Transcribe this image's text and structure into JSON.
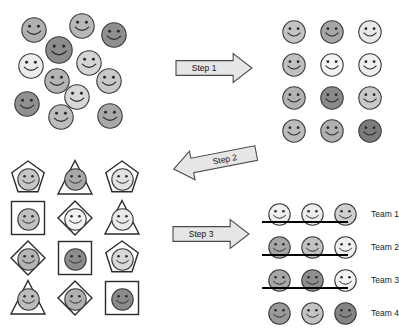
{
  "diagram": {
    "face_icon": "smiley-face-icon"
  },
  "panels": {
    "unsorted": {
      "name": "unsorted-crowd",
      "faces": [
        {
          "x": 21,
          "y": 17,
          "r": 13,
          "shade": "#b0b0b0"
        },
        {
          "x": 69,
          "y": 13,
          "r": 13,
          "shade": "#b8b8b8"
        },
        {
          "x": 101,
          "y": 22,
          "r": 13,
          "shade": "#8f8f8f"
        },
        {
          "x": 45,
          "y": 36,
          "r": 14,
          "shade": "#8c8c8c"
        },
        {
          "x": 18,
          "y": 53,
          "r": 13,
          "shade": "#ececec"
        },
        {
          "x": 76,
          "y": 50,
          "r": 13,
          "shade": "#d5d5d5"
        },
        {
          "x": 44,
          "y": 68,
          "r": 13,
          "shade": "#b4b4b4"
        },
        {
          "x": 96,
          "y": 68,
          "r": 13,
          "shade": "#c8c8c8"
        },
        {
          "x": 64,
          "y": 84,
          "r": 13,
          "shade": "#d8d8d8"
        },
        {
          "x": 14,
          "y": 91,
          "r": 13,
          "shade": "#909090"
        },
        {
          "x": 48,
          "y": 104,
          "r": 13,
          "shade": "#bdbdbd"
        },
        {
          "x": 97,
          "y": 103,
          "r": 13,
          "shade": "#a8a8a8"
        }
      ]
    },
    "sorted_grid": {
      "name": "sorted-grid",
      "origin": {
        "x": 282,
        "y": 20
      },
      "step_x": 38,
      "step_y": 33,
      "rows": [
        [
          "#c4c4c4",
          "#a6a6a6",
          "#e8e8e8"
        ],
        [
          "#c0c0c0",
          "#f2f2f2",
          "#f0f0f0"
        ],
        [
          "#b2b2b2",
          "#8a8a8a",
          "#c9c9c9"
        ],
        [
          "#bcbcbc",
          "#b0b0b0",
          "#7c7c7c"
        ]
      ]
    },
    "shaped_grid": {
      "name": "shaped-grid",
      "origin": {
        "x": 28,
        "y": 178
      },
      "step_x": 47,
      "step_y": 40,
      "cells": [
        [
          {
            "shape": "pentagon",
            "shade": "#c6c6c6"
          },
          {
            "shape": "triangle",
            "shade": "#a8a8a8"
          },
          {
            "shape": "pentagon",
            "shade": "#e2e2e2"
          }
        ],
        [
          {
            "shape": "square",
            "shade": "#c0c0c0"
          },
          {
            "shape": "diamond",
            "shade": "#f2f2f2"
          },
          {
            "shape": "triangle",
            "shade": "#eaeaea"
          }
        ],
        [
          {
            "shape": "diamond",
            "shade": "#b4b4b4"
          },
          {
            "shape": "square",
            "shade": "#8c8c8c"
          },
          {
            "shape": "pentagon",
            "shade": "#d8d8d8"
          }
        ],
        [
          {
            "shape": "triangle",
            "shade": "#bcbcbc"
          },
          {
            "shape": "diamond",
            "shade": "#b0b0b0"
          },
          {
            "shape": "square",
            "shade": "#8a8a8a"
          }
        ]
      ]
    },
    "teams": {
      "name": "teams-panel",
      "origin": {
        "x": 268,
        "y": 203
      },
      "step_x": 33,
      "step_y": 33,
      "rows": [
        {
          "label": "Team 1",
          "shades": [
            "#efefef",
            "#ececec",
            "#cfcfcf"
          ]
        },
        {
          "label": "Team 2",
          "shades": [
            "#a6a6a6",
            "#c2c2c2",
            "#f0f0f0"
          ]
        },
        {
          "label": "Team 3",
          "shades": [
            "#a8a8a8",
            "#8e8e8e",
            "#f4f4f4"
          ]
        },
        {
          "label": "Team 4",
          "shades": [
            "#9a9a9a",
            "#c4c4c4",
            "#848484"
          ]
        }
      ],
      "separators": [
        {
          "x": 262,
          "y": 221,
          "w": 86
        },
        {
          "x": 262,
          "y": 254,
          "w": 86
        },
        {
          "x": 262,
          "y": 287,
          "w": 86
        }
      ]
    }
  },
  "arrows": [
    {
      "name": "step-1-arrow",
      "label": "Step 1",
      "direction": "right",
      "x": 175,
      "y": 52,
      "w": 78,
      "h": 32,
      "rotation": 0
    },
    {
      "name": "step-2-arrow",
      "label": "Step 2",
      "direction": "left",
      "x": 172,
      "y": 145,
      "w": 86,
      "h": 32,
      "rotation": -11
    },
    {
      "name": "step-3-arrow",
      "label": "Step 3",
      "direction": "right",
      "x": 172,
      "y": 218,
      "w": 78,
      "h": 32,
      "rotation": 0
    }
  ],
  "style": {
    "outline": "#3a3a3a",
    "shape_outline": "#2b2b2b",
    "arrow_fill": "#e6e6e6",
    "arrow_stroke": "#4a4a4a",
    "separator_color": "#000000",
    "background": "#ffffff"
  }
}
